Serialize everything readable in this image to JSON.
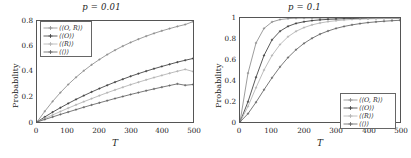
{
  "figure": {
    "panels": [
      {
        "id": "panel-left",
        "title_var": "p",
        "title_eq": "=",
        "title_value": "0.01",
        "title_full": "p = 0.01",
        "ylabel": "Probability",
        "xlabel": "T",
        "yticks": [
          "0",
          "0.2",
          "0.4",
          "0.6",
          "0.8"
        ],
        "xticks": [
          "0",
          "100",
          "200",
          "300",
          "400",
          "500"
        ],
        "legend_position": "top-left",
        "legend": [
          {
            "label": "⟨⟨O, R⟩⟩",
            "color": "#8a8a8a"
          },
          {
            "label": "⟨⟨O⟩⟩",
            "color": "#3a3a3a"
          },
          {
            "label": "⟨⟨R⟩⟩",
            "color": "#b0b0b0"
          },
          {
            "label": "⟨⟨⟩⟩",
            "color": "#606060"
          }
        ]
      },
      {
        "id": "panel-right",
        "title_var": "p",
        "title_eq": "=",
        "title_value": "0.1",
        "title_full": "p = 0.1",
        "ylabel": "Probability",
        "xlabel": "T",
        "yticks": [
          "0",
          "0.2",
          "0.4",
          "0.6",
          "0.8",
          "1"
        ],
        "xticks": [
          "0",
          "100",
          "200",
          "300",
          "400",
          "500"
        ],
        "legend_position": "bottom-right",
        "legend": [
          {
            "label": "⟨⟨O, R⟩⟩",
            "color": "#8a8a8a"
          },
          {
            "label": "⟨⟨O⟩⟩",
            "color": "#3a3a3a"
          },
          {
            "label": "⟨⟨R⟩⟩",
            "color": "#b0b0b0"
          },
          {
            "label": "⟨⟨⟩⟩",
            "color": "#606060"
          }
        ]
      }
    ]
  },
  "chart_data": [
    {
      "type": "line",
      "title": "p = 0.01",
      "xlabel": "T",
      "ylabel": "Probability",
      "xlim": [
        0,
        500
      ],
      "ylim": [
        0,
        0.8
      ],
      "xticks": [
        0,
        100,
        200,
        300,
        400,
        500
      ],
      "yticks": [
        0,
        0.2,
        0.4,
        0.6,
        0.8
      ],
      "grid": false,
      "legend_position": "upper left",
      "x": [
        0,
        25,
        50,
        75,
        100,
        125,
        150,
        175,
        200,
        225,
        250,
        275,
        300,
        325,
        350,
        375,
        400,
        425,
        450,
        475,
        500
      ],
      "series": [
        {
          "name": "⟨⟨O, R⟩⟩",
          "color": "#8a8a8a",
          "marker": "plus",
          "values": [
            0.0,
            0.085,
            0.163,
            0.233,
            0.297,
            0.354,
            0.406,
            0.453,
            0.495,
            0.534,
            0.569,
            0.601,
            0.63,
            0.656,
            0.68,
            0.702,
            0.722,
            0.74,
            0.757,
            0.772,
            0.795
          ]
        },
        {
          "name": "⟨⟨O⟩⟩",
          "color": "#3a3a3a",
          "marker": "plus",
          "values": [
            0.0,
            0.04,
            0.078,
            0.113,
            0.147,
            0.179,
            0.209,
            0.238,
            0.265,
            0.291,
            0.316,
            0.339,
            0.362,
            0.383,
            0.403,
            0.422,
            0.44,
            0.457,
            0.474,
            0.489,
            0.503
          ]
        },
        {
          "name": "⟨⟨R⟩⟩",
          "color": "#b0b0b0",
          "marker": "plus",
          "values": [
            0.0,
            0.028,
            0.056,
            0.083,
            0.11,
            0.136,
            0.161,
            0.185,
            0.209,
            0.232,
            0.254,
            0.275,
            0.296,
            0.315,
            0.334,
            0.352,
            0.369,
            0.386,
            0.402,
            0.417,
            0.4
          ]
        },
        {
          "name": "⟨⟨⟩⟩",
          "color": "#606060",
          "marker": "plus",
          "values": [
            0.0,
            0.02,
            0.04,
            0.06,
            0.079,
            0.098,
            0.117,
            0.135,
            0.152,
            0.169,
            0.186,
            0.202,
            0.218,
            0.233,
            0.248,
            0.262,
            0.276,
            0.289,
            0.302,
            0.291,
            0.297
          ]
        }
      ]
    },
    {
      "type": "line",
      "title": "p = 0.1",
      "xlabel": "T",
      "ylabel": "Probability",
      "xlim": [
        0,
        500
      ],
      "ylim": [
        0,
        1
      ],
      "xticks": [
        0,
        100,
        200,
        300,
        400,
        500
      ],
      "yticks": [
        0,
        0.2,
        0.4,
        0.6,
        0.8,
        1
      ],
      "grid": false,
      "legend_position": "lower right",
      "x": [
        0,
        25,
        50,
        75,
        100,
        125,
        150,
        175,
        200,
        225,
        250,
        275,
        300,
        325,
        350,
        375,
        400,
        425,
        450,
        475,
        500
      ],
      "series": [
        {
          "name": "⟨⟨O, R⟩⟩",
          "color": "#8a8a8a",
          "marker": "plus",
          "values": [
            0.0,
            0.47,
            0.76,
            0.9,
            0.962,
            0.985,
            0.994,
            0.998,
            0.999,
            1.0,
            1.0,
            1.0,
            1.0,
            1.0,
            1.0,
            1.0,
            1.0,
            1.0,
            1.0,
            1.0,
            1.0
          ]
        },
        {
          "name": "⟨⟨O⟩⟩",
          "color": "#3a3a3a",
          "marker": "plus",
          "values": [
            0.0,
            0.195,
            0.43,
            0.64,
            0.79,
            0.873,
            0.92,
            0.948,
            0.964,
            0.975,
            0.982,
            0.987,
            0.99,
            0.993,
            0.995,
            0.996,
            0.997,
            0.998,
            0.998,
            0.999,
            0.999
          ]
        },
        {
          "name": "⟨⟨R⟩⟩",
          "color": "#b0b0b0",
          "marker": "plus",
          "values": [
            0.0,
            0.15,
            0.33,
            0.5,
            0.64,
            0.745,
            0.82,
            0.872,
            0.908,
            0.934,
            0.952,
            0.965,
            0.974,
            0.981,
            0.986,
            0.989,
            0.992,
            0.994,
            0.995,
            0.996,
            0.997
          ]
        },
        {
          "name": "⟨⟨⟩⟩",
          "color": "#606060",
          "marker": "plus",
          "values": [
            0.0,
            0.08,
            0.19,
            0.31,
            0.425,
            0.53,
            0.62,
            0.695,
            0.756,
            0.805,
            0.845,
            0.875,
            0.9,
            0.919,
            0.934,
            0.946,
            0.956,
            0.963,
            0.969,
            0.974,
            0.978
          ]
        }
      ]
    }
  ]
}
